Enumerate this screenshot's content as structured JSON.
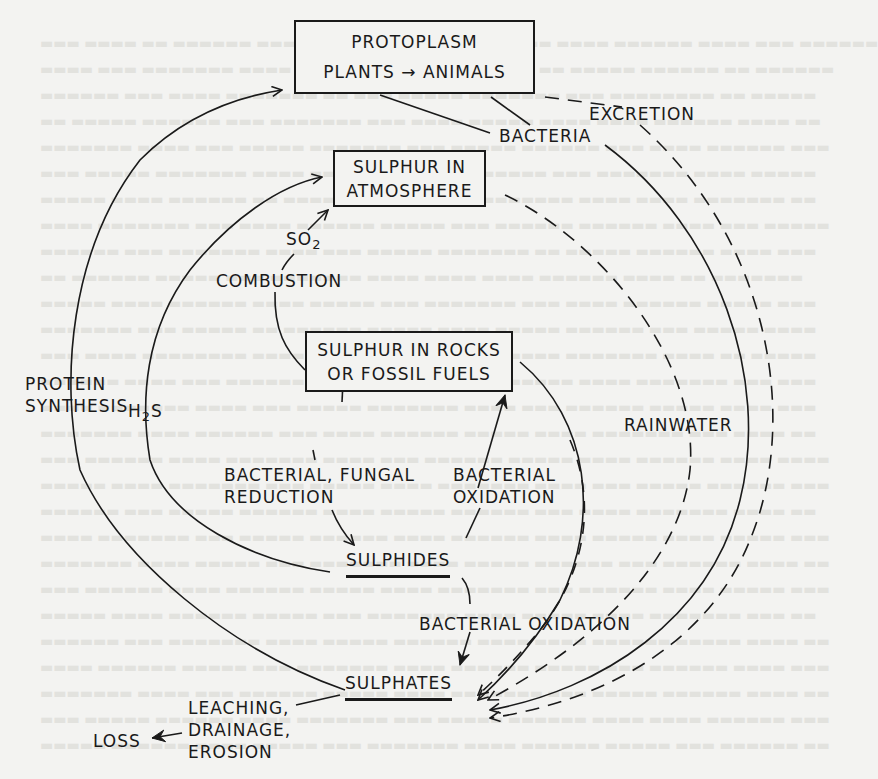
{
  "boxes": {
    "protoplasm": {
      "line1": "PROTOPLASM",
      "line2_left": "PLANTS",
      "line2_arrow": "→",
      "line2_right": "ANIMALS"
    },
    "atmosphere": {
      "line1": "SULPHUR IN",
      "line2": "ATMOSPHERE"
    },
    "rocks": {
      "line1": "SULPHUR IN ROCKS",
      "line2": "OR FOSSIL FUELS"
    }
  },
  "nodes": {
    "sulphides": "SULPHIDES",
    "sulphates": "SULPHATES",
    "loss": "LOSS"
  },
  "labels": {
    "excretion": "EXCRETION",
    "bacteria": "BACTERIA",
    "so2_main": "SO",
    "so2_sub": "2",
    "combustion": "COMBUSTION",
    "protein_1": "PROTEIN",
    "protein_2": "SYNTHESIS",
    "h2s_h": "H",
    "h2s_sub": "2",
    "h2s_s": "S",
    "rainwater": "RAINWATER",
    "bfr_1": "BACTERIAL, FUNGAL",
    "bfr_2": "REDUCTION",
    "box_1": "BACTERIAL",
    "box_2": "OXIDATION",
    "bac_ox": "BACTERIAL  OXIDATION",
    "leach_1": "LEACHING,",
    "leach_2": "DRAINAGE,",
    "leach_3": "EROSION"
  },
  "colors": {
    "ink": "#1a1a1a",
    "paper": "#f3f3f1"
  }
}
